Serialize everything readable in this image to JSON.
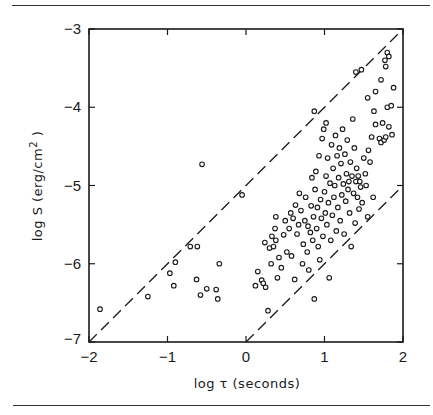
{
  "chart_data": {
    "type": "scatter",
    "title": "",
    "xlabel": "log τ (seconds)",
    "ylabel": "log  S  (erg/cm²)",
    "xlim": [
      -2,
      2
    ],
    "ylim": [
      -7,
      -3
    ],
    "xticks": [
      -2,
      -1,
      0,
      1,
      2
    ],
    "yticks": [
      -7,
      -6,
      -5,
      -4,
      -3
    ],
    "xtick_labels": [
      "-2",
      "-1",
      "0",
      "1",
      "2"
    ],
    "ytick_labels": [
      "-7",
      "-6",
      "-5",
      "-4",
      "-3"
    ],
    "grid": false,
    "legend": null,
    "marker": "open-circle",
    "reference_lines": [
      {
        "name": "upper-dashed",
        "style": "dashed",
        "points": [
          [
            -2,
            -7
          ],
          [
            2,
            -3
          ]
        ]
      },
      {
        "name": "lower-dashed",
        "style": "dashed",
        "points": [
          [
            0,
            -7
          ],
          [
            2,
            -5
          ]
        ]
      }
    ],
    "series": [
      {
        "name": "events",
        "points": [
          [
            -1.86,
            -6.58
          ],
          [
            -1.25,
            -6.42
          ],
          [
            -0.97,
            -6.12
          ],
          [
            -0.92,
            -6.28
          ],
          [
            -0.9,
            -5.98
          ],
          [
            -0.71,
            -5.78
          ],
          [
            -0.63,
            -6.2
          ],
          [
            -0.62,
            -5.78
          ],
          [
            -0.58,
            -6.4
          ],
          [
            -0.56,
            -4.73
          ],
          [
            -0.5,
            -6.32
          ],
          [
            -0.38,
            -6.33
          ],
          [
            -0.34,
            -6.0
          ],
          [
            -0.36,
            -6.45
          ],
          [
            -0.05,
            -5.12
          ],
          [
            0.15,
            -6.1
          ],
          [
            0.12,
            -6.28
          ],
          [
            0.2,
            -6.21
          ],
          [
            0.22,
            -6.25
          ],
          [
            0.24,
            -5.73
          ],
          [
            0.25,
            -6.3
          ],
          [
            0.28,
            -6.6
          ],
          [
            0.3,
            -5.8
          ],
          [
            0.32,
            -6.0
          ],
          [
            0.33,
            -5.65
          ],
          [
            0.35,
            -5.78
          ],
          [
            0.37,
            -5.55
          ],
          [
            0.38,
            -5.7
          ],
          [
            0.4,
            -6.18
          ],
          [
            0.42,
            -5.92
          ],
          [
            0.45,
            -6.05
          ],
          [
            0.48,
            -5.63
          ],
          [
            0.5,
            -5.45
          ],
          [
            0.52,
            -5.85
          ],
          [
            0.55,
            -5.55
          ],
          [
            0.57,
            -5.35
          ],
          [
            0.58,
            -5.9
          ],
          [
            0.6,
            -5.42
          ],
          [
            0.62,
            -6.2
          ],
          [
            0.63,
            -5.25
          ],
          [
            0.65,
            -5.62
          ],
          [
            0.67,
            -5.5
          ],
          [
            0.68,
            -5.1
          ],
          [
            0.7,
            -5.32
          ],
          [
            0.72,
            -6.0
          ],
          [
            0.73,
            -5.75
          ],
          [
            0.75,
            -5.45
          ],
          [
            0.76,
            -5.15
          ],
          [
            0.78,
            -5.85
          ],
          [
            0.79,
            -5.52
          ],
          [
            0.8,
            -6.08
          ],
          [
            0.82,
            -5.6
          ],
          [
            0.83,
            -5.26
          ],
          [
            0.84,
            -4.9
          ],
          [
            0.85,
            -5.7
          ],
          [
            0.86,
            -5.4
          ],
          [
            0.87,
            -6.45
          ],
          [
            0.88,
            -5.05
          ],
          [
            0.89,
            -4.82
          ],
          [
            0.9,
            -5.55
          ],
          [
            0.91,
            -5.28
          ],
          [
            0.92,
            -5.78
          ],
          [
            0.93,
            -4.62
          ],
          [
            0.94,
            -5.95
          ],
          [
            0.95,
            -5.18
          ],
          [
            0.96,
            -5.42
          ],
          [
            0.97,
            -4.4
          ],
          [
            0.98,
            -5.65
          ],
          [
            0.99,
            -4.28
          ],
          [
            1.0,
            -5.08
          ],
          [
            1.01,
            -5.35
          ],
          [
            1.02,
            -4.88
          ],
          [
            1.03,
            -5.5
          ],
          [
            1.04,
            -4.65
          ],
          [
            1.05,
            -5.22
          ],
          [
            1.06,
            -6.18
          ],
          [
            1.07,
            -4.97
          ],
          [
            1.08,
            -5.7
          ],
          [
            1.09,
            -4.48
          ],
          [
            1.1,
            -5.38
          ],
          [
            1.11,
            -4.78
          ],
          [
            1.12,
            -5.15
          ],
          [
            1.13,
            -5.0
          ],
          [
            1.14,
            -4.36
          ],
          [
            1.15,
            -5.58
          ],
          [
            1.16,
            -4.62
          ],
          [
            1.17,
            -5.28
          ],
          [
            1.18,
            -4.9
          ],
          [
            1.19,
            -4.52
          ],
          [
            1.2,
            -5.45
          ],
          [
            1.21,
            -4.72
          ],
          [
            1.22,
            -5.12
          ],
          [
            1.23,
            -4.28
          ],
          [
            1.24,
            -4.98
          ],
          [
            1.25,
            -5.62
          ],
          [
            1.26,
            -4.6
          ],
          [
            1.27,
            -5.2
          ],
          [
            1.28,
            -4.85
          ],
          [
            1.29,
            -4.42
          ],
          [
            1.3,
            -5.05
          ],
          [
            1.31,
            -4.95
          ],
          [
            1.32,
            -5.35
          ],
          [
            1.33,
            -4.7
          ],
          [
            1.34,
            -5.78
          ],
          [
            1.35,
            -4.88
          ],
          [
            1.36,
            -4.15
          ],
          [
            1.37,
            -5.1
          ],
          [
            1.38,
            -4.52
          ],
          [
            1.39,
            -5.48
          ],
          [
            1.4,
            -4.95
          ],
          [
            1.41,
            -4.78
          ],
          [
            1.42,
            -5.15
          ],
          [
            1.43,
            -4.88
          ],
          [
            1.44,
            -5.3
          ],
          [
            1.45,
            -4.95
          ],
          [
            1.46,
            -5.02
          ],
          [
            1.48,
            -5.22
          ],
          [
            1.5,
            -4.65
          ],
          [
            1.52,
            -4.85
          ],
          [
            1.53,
            -5.0
          ],
          [
            1.55,
            -5.4
          ],
          [
            1.56,
            -4.55
          ],
          [
            1.58,
            -4.7
          ],
          [
            1.6,
            -4.38
          ],
          [
            1.62,
            -5.15
          ],
          [
            1.63,
            -4.05
          ],
          [
            1.65,
            -4.22
          ],
          [
            1.7,
            -4.4
          ],
          [
            1.72,
            -4.45
          ],
          [
            1.74,
            -4.2
          ],
          [
            1.76,
            -4.42
          ],
          [
            1.78,
            -4.38
          ],
          [
            1.8,
            -4.0
          ],
          [
            1.82,
            -4.25
          ],
          [
            1.85,
            -3.98
          ],
          [
            1.86,
            -4.35
          ],
          [
            1.88,
            -3.75
          ],
          [
            1.4,
            -3.55
          ],
          [
            1.47,
            -3.52
          ],
          [
            1.72,
            -3.65
          ],
          [
            1.77,
            -3.4
          ],
          [
            1.78,
            -3.48
          ],
          [
            1.8,
            -3.3
          ],
          [
            1.82,
            -3.35
          ],
          [
            1.55,
            -3.88
          ],
          [
            1.65,
            -3.8
          ],
          [
            0.87,
            -4.05
          ],
          [
            1.02,
            -4.2
          ],
          [
            0.38,
            -5.4
          ]
        ]
      }
    ]
  },
  "axes": {
    "x_title": "log τ (seconds)",
    "y_title": "log  S  (erg/cm²)",
    "x_ticks": [
      "-2",
      "-1",
      "0",
      "1",
      "2"
    ],
    "y_ticks": [
      "-3",
      "-4",
      "-5",
      "-6",
      "-7"
    ]
  }
}
